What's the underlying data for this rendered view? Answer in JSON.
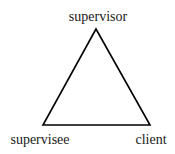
{
  "diagram": {
    "type": "triangle",
    "nodes": [
      {
        "id": "top",
        "label": "supervisor"
      },
      {
        "id": "bottom-left",
        "label": "supervisee"
      },
      {
        "id": "bottom-right",
        "label": "client"
      }
    ],
    "edges": [
      [
        "supervisor",
        "supervisee"
      ],
      [
        "supervisee",
        "client"
      ],
      [
        "client",
        "supervisor"
      ]
    ],
    "colors": {
      "line": "#000000",
      "text": "#1a1a1a",
      "background": "#ffffff"
    }
  }
}
